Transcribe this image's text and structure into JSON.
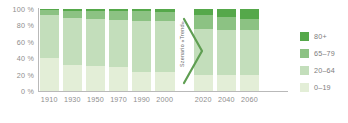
{
  "chart_data": {
    "type": "bar",
    "title": "",
    "subtitle": "",
    "xlabel": "",
    "ylabel": "",
    "stacked": true,
    "normalized_percent": true,
    "grid": false,
    "legend_position": "right",
    "ylim": [
      0,
      100
    ],
    "yticks": [
      0,
      20,
      40,
      60,
      80,
      100
    ],
    "ytick_labels": [
      "0 %",
      "20 %",
      "40 %",
      "60 %",
      "80 %",
      "100 %"
    ],
    "categories": [
      "1910",
      "1930",
      "1950",
      "1970",
      "1990",
      "2000",
      "2020",
      "2040",
      "2060"
    ],
    "series": [
      {
        "name": "0–19",
        "color": "#e3eed7",
        "values": [
          40,
          32,
          30,
          29,
          23,
          23,
          20,
          20,
          20
        ]
      },
      {
        "name": "20–64",
        "color": "#c3debb",
        "values": [
          53,
          57,
          58,
          58,
          62,
          62,
          56,
          55,
          55
        ]
      },
      {
        "name": "65–79",
        "color": "#8cc283",
        "values": [
          6,
          9,
          10,
          11,
          12,
          11,
          17,
          15,
          13
        ]
      },
      {
        "name": "80+",
        "color": "#55a84a",
        "values": [
          1,
          2,
          2,
          2,
          3,
          4,
          7,
          10,
          12
        ]
      }
    ],
    "annotations": [
      {
        "name": "scenario-divider",
        "text": "Szenario «Trend»",
        "between": [
          "2000",
          "2020"
        ],
        "shape": "chevron-right",
        "color": "#5f9e52"
      }
    ]
  },
  "axes": {
    "y_ticks": [
      {
        "label": "100 %",
        "value": 100
      },
      {
        "label": "80 %",
        "value": 80
      },
      {
        "label": "60 %",
        "value": 60
      },
      {
        "label": "40 %",
        "value": 40
      },
      {
        "label": "20 %",
        "value": 20
      },
      {
        "label": "0 %",
        "value": 0
      }
    ],
    "x_ticks": [
      {
        "label": "1910"
      },
      {
        "label": "1930"
      },
      {
        "label": "1950"
      },
      {
        "label": "1970"
      },
      {
        "label": "1990"
      },
      {
        "label": "2000"
      },
      {
        "label": "2020"
      },
      {
        "label": "2040"
      },
      {
        "label": "2060"
      }
    ]
  },
  "legend": {
    "items": [
      {
        "label": "80+",
        "color": "#55a84a"
      },
      {
        "label": "65–79",
        "color": "#8cc283"
      },
      {
        "label": "20–64",
        "color": "#c3debb"
      },
      {
        "label": "0–19",
        "color": "#e3eed7"
      }
    ]
  },
  "scenario": {
    "label": "Szenario «Trend»"
  },
  "colors": {
    "axis": "#b9b9b9",
    "tick_text": "#8e8e8e",
    "legend_text": "#7d7d7d",
    "divider": "#5f9e52",
    "background": "#ffffff"
  }
}
